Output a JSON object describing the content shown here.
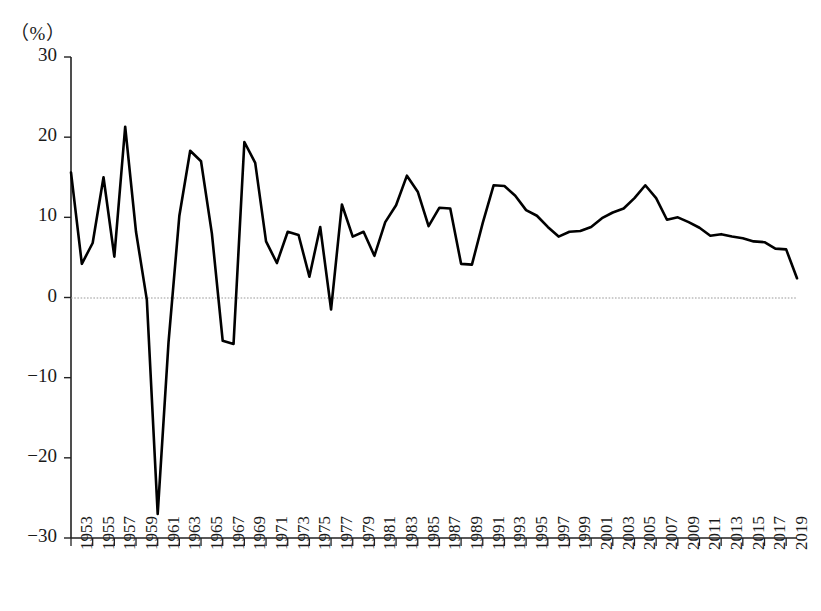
{
  "chart_data": {
    "type": "line",
    "title": "",
    "subtitle": "",
    "xlabel": "",
    "ylabel": "",
    "unit_label": "（%）",
    "ylim": [
      -30,
      30
    ],
    "xlim": [
      1953,
      2020
    ],
    "grid": false,
    "zero_line": true,
    "legend": "none",
    "yticks": [
      30,
      20,
      10,
      0,
      -10,
      -20,
      -30
    ],
    "ytick_labels": [
      "30",
      "20",
      "10",
      "0",
      "−10",
      "−20",
      "−30"
    ],
    "xticks": [
      1953,
      1955,
      1957,
      1959,
      1961,
      1963,
      1965,
      1967,
      1969,
      1971,
      1973,
      1975,
      1977,
      1979,
      1981,
      1983,
      1985,
      1987,
      1989,
      1991,
      1993,
      1995,
      1997,
      1999,
      2001,
      2003,
      2005,
      2007,
      2009,
      2011,
      2013,
      2015,
      2017,
      2019
    ],
    "xtick_labels": [
      "1953",
      "1955",
      "1957",
      "1959",
      "1961",
      "1963",
      "1965",
      "1967",
      "1969",
      "1971",
      "1973",
      "1975",
      "1977",
      "1979",
      "1981",
      "1983",
      "1985",
      "1987",
      "1989",
      "1991",
      "1993",
      "1995",
      "1997",
      "1999",
      "2001",
      "2003",
      "2005",
      "2007",
      "2009",
      "2011",
      "2013",
      "2015",
      "2017",
      "2019"
    ],
    "line_color": "#000000",
    "line_width": 2.6,
    "x": [
      1953,
      1954,
      1955,
      1956,
      1957,
      1958,
      1959,
      1960,
      1961,
      1962,
      1963,
      1964,
      1965,
      1966,
      1967,
      1968,
      1969,
      1970,
      1971,
      1972,
      1973,
      1974,
      1975,
      1976,
      1977,
      1978,
      1979,
      1980,
      1981,
      1982,
      1983,
      1984,
      1985,
      1986,
      1987,
      1988,
      1989,
      1990,
      1991,
      1992,
      1993,
      1994,
      1995,
      1996,
      1997,
      1998,
      1999,
      2000,
      2001,
      2002,
      2003,
      2004,
      2005,
      2006,
      2007,
      2008,
      2009,
      2010,
      2011,
      2012,
      2013,
      2014,
      2015,
      2016,
      2017,
      2018,
      2019,
      2020
    ],
    "values": [
      15.6,
      4.2,
      6.8,
      15.0,
      5.1,
      21.3,
      8.2,
      -0.3,
      -27.0,
      -5.6,
      10.2,
      18.3,
      17.0,
      8.0,
      -5.4,
      -5.8,
      19.4,
      16.8,
      7.0,
      4.3,
      8.2,
      7.8,
      2.6,
      8.8,
      -1.5,
      11.6,
      7.6,
      8.2,
      5.2,
      9.4,
      11.5,
      15.2,
      13.2,
      8.9,
      11.2,
      11.1,
      4.2,
      4.1,
      9.3,
      14.0,
      13.9,
      12.7,
      10.9,
      10.2,
      8.8,
      7.6,
      8.2,
      8.3,
      8.8,
      9.9,
      10.6,
      11.1,
      12.4,
      14.0,
      12.4,
      9.7,
      10.0,
      9.4,
      8.7,
      7.7,
      7.9,
      7.6,
      7.4,
      7.0,
      6.9,
      6.1,
      6.0,
      2.4
    ]
  }
}
